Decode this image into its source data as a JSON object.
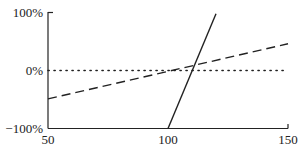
{
  "chart_data": {
    "type": "line",
    "title": "",
    "xlabel": "",
    "ylabel": "",
    "xlim": [
      50,
      150
    ],
    "ylim": [
      -100,
      100
    ],
    "x_ticks": [
      50,
      100,
      150
    ],
    "x_tick_labels": [
      "50",
      "100",
      "150"
    ],
    "y_ticks": [
      -100,
      0,
      100
    ],
    "y_tick_labels": [
      "−100%",
      "0%",
      "100%"
    ],
    "grid": false,
    "legend": null,
    "series": [
      {
        "name": "dashed",
        "style": "dashed",
        "color": "#222222",
        "x": [
          50,
          150
        ],
        "y": [
          -49,
          46
        ]
      },
      {
        "name": "solid",
        "style": "solid",
        "color": "#222222",
        "x": [
          100,
          120
        ],
        "y": [
          -100,
          98
        ]
      },
      {
        "name": "zero-reference",
        "style": "dotted",
        "color": "#222222",
        "x": [
          50,
          150
        ],
        "y": [
          0,
          0
        ]
      }
    ]
  }
}
